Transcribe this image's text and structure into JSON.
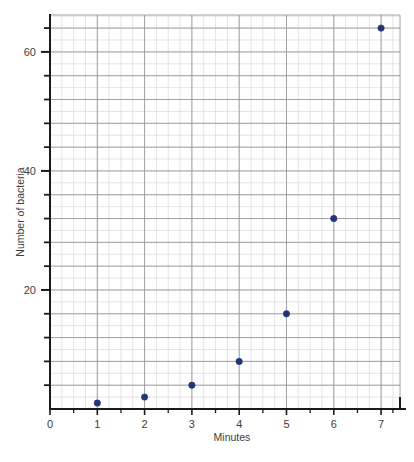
{
  "chart_data": {
    "type": "scatter",
    "title": "",
    "xlabel": "Minutes",
    "ylabel": "Number of bacteria",
    "x": [
      1,
      2,
      3,
      4,
      5,
      6,
      7
    ],
    "values": [
      1,
      2,
      4,
      8,
      16,
      32,
      64
    ],
    "series": [
      {
        "name": "Number of bacteria",
        "points": [
          {
            "x": 1,
            "y": 1
          },
          {
            "x": 2,
            "y": 2
          },
          {
            "x": 3,
            "y": 4
          },
          {
            "x": 4,
            "y": 8
          },
          {
            "x": 5,
            "y": 16
          },
          {
            "x": 6,
            "y": 32
          },
          {
            "x": 7,
            "y": 64
          }
        ]
      }
    ],
    "xlim": [
      0,
      7.4
    ],
    "ylim": [
      0,
      66.2
    ],
    "x_ticks": [
      0,
      1,
      2,
      3,
      4,
      5,
      6,
      7
    ],
    "x_tick_labels": [
      "0",
      "1",
      "2",
      "3",
      "4",
      "5",
      "6",
      "7"
    ],
    "y_ticks": [
      20,
      40,
      60
    ],
    "y_tick_labels": [
      "20",
      "40",
      "60"
    ],
    "y_minor_tick_step": 4,
    "grid": true,
    "grid_minor_step_x": 0.25,
    "grid_minor_step_y": 2,
    "grid_major_step_x": 1,
    "grid_major_step_y": 4,
    "legend": "none",
    "marker_color": "#22357a",
    "grid_minor_color": "#d8d8dc",
    "grid_major_color": "#9a9a9e",
    "axis_color": "#1a1a1a"
  },
  "axis": {
    "x_title": "Minutes",
    "y_title": "Number of bacteria",
    "x_labels": [
      "0",
      "1",
      "2",
      "3",
      "4",
      "5",
      "6",
      "7"
    ],
    "y_labels": [
      "20",
      "40",
      "60"
    ]
  }
}
